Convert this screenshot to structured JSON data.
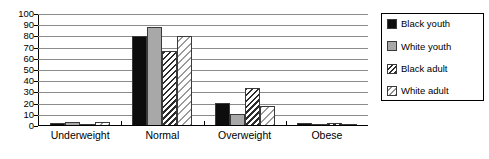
{
  "chart_data": {
    "type": "bar",
    "title": "",
    "subtitle": "",
    "xlabel": "",
    "ylabel": "",
    "ylim": [
      0,
      100
    ],
    "ytick_step": 10,
    "yticks": [
      0,
      10,
      20,
      30,
      40,
      50,
      60,
      70,
      80,
      90,
      100
    ],
    "grid": true,
    "grid_axis": "y",
    "legend_position": "right",
    "categories": [
      "Underweight",
      "Normal",
      "Overweight",
      "Obese"
    ],
    "series": [
      {
        "name": "Black youth",
        "values": [
          2,
          80,
          20,
          1.5
        ],
        "pattern": "solid-black",
        "color": "#0d0d0d"
      },
      {
        "name": "White youth",
        "values": [
          3,
          88,
          10,
          1
        ],
        "pattern": "solid-gray",
        "color": "#a8a8a8"
      },
      {
        "name": "Black adult",
        "values": [
          0,
          67,
          33,
          1.5
        ],
        "pattern": "dark-diagonal-hatch",
        "color": "#2b2b2b"
      },
      {
        "name": "White adult",
        "values": [
          2.5,
          80,
          17,
          1
        ],
        "pattern": "light-diagonal-hatch",
        "color": "#9a9a9a"
      }
    ]
  },
  "legend": {
    "items": [
      {
        "label": "Black youth"
      },
      {
        "label": "White youth"
      },
      {
        "label": "Black adult"
      },
      {
        "label": "White adult"
      }
    ]
  }
}
